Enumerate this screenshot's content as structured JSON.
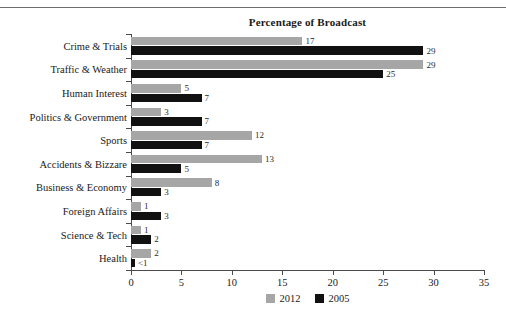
{
  "page": {
    "clipped_header_text": "",
    "rule": "horizontal-rule"
  },
  "chart_data": {
    "type": "bar",
    "orientation": "horizontal",
    "title": "Percentage of Broadcast",
    "xlabel": "",
    "ylabel": "",
    "xlim": [
      0,
      35
    ],
    "xticks": [
      "0",
      "5",
      "10",
      "15",
      "20",
      "25",
      "30",
      "35"
    ],
    "grid": false,
    "legend_position": "bottom-center",
    "categories": [
      "Crime & Trials",
      "Traffic & Weather",
      "Human Interest",
      "Politics & Government",
      "Sports",
      "Accidents & Bizzare",
      "Business & Economy",
      "Foreign Affairs",
      "Science & Tech",
      "Health"
    ],
    "series": [
      {
        "name": "2012",
        "color": "#a6a6a6",
        "values": [
          17,
          29,
          5,
          3,
          12,
          13,
          8,
          1,
          1,
          2
        ],
        "labels": [
          "17",
          "29",
          "5",
          "3",
          "12",
          "13",
          "8",
          "1",
          "1",
          "2"
        ]
      },
      {
        "name": "2005",
        "color": "#111111",
        "values": [
          29,
          25,
          7,
          7,
          7,
          5,
          3,
          3,
          2,
          0.4
        ],
        "labels": [
          "29",
          "25",
          "7",
          "7",
          "7",
          "5",
          "3",
          "3",
          "2",
          "<1"
        ]
      }
    ]
  }
}
